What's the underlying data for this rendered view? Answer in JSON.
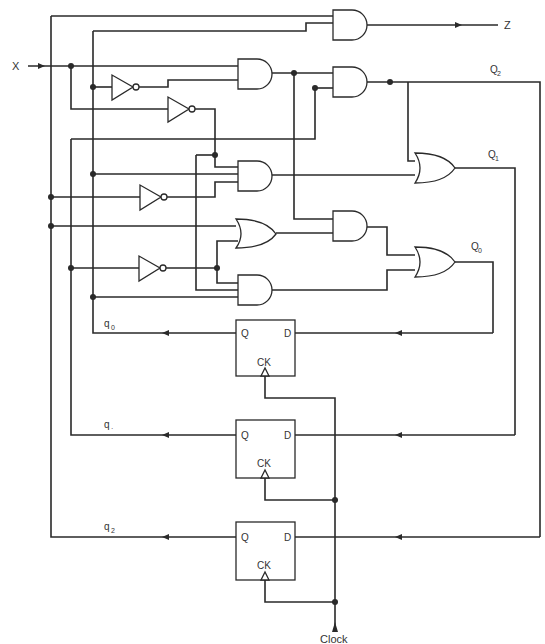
{
  "diagram": {
    "type": "sequential logic circuit",
    "inputs": {
      "x": "X",
      "clock": "Clock"
    },
    "output": {
      "z": "Z"
    },
    "next_state_labels": [
      {
        "main": "Q",
        "sub": "2"
      },
      {
        "main": "Q",
        "sub": "1"
      },
      {
        "main": "Q",
        "sub": "0"
      }
    ],
    "state_labels": [
      {
        "main": "q",
        "sub": "0"
      },
      {
        "main": "q",
        "sub": "·"
      },
      {
        "main": "q",
        "sub": "2"
      }
    ],
    "flip_flops": [
      {
        "q": "Q",
        "d": "D",
        "ck": "CK"
      },
      {
        "q": "Q",
        "d": "D",
        "ck": "CK"
      },
      {
        "q": "Q",
        "d": "D",
        "ck": "CK"
      }
    ],
    "gates": {
      "and_count": 6,
      "or_count": 3,
      "not_count": 4
    }
  }
}
